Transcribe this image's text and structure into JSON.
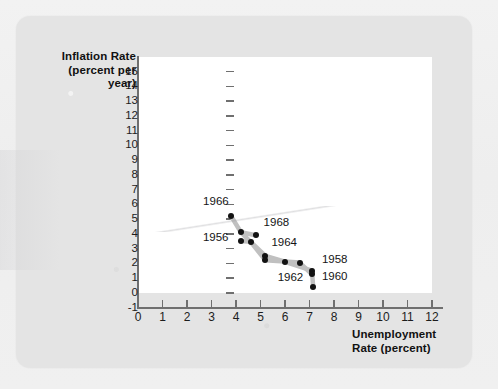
{
  "figure": {
    "y_axis_title_line1": "Inflation Rate",
    "y_axis_title_line2": "(percent per year)",
    "x_axis_title_line1": "Unemployment",
    "x_axis_title_line2": "Rate (percent)",
    "point_color": "#121212",
    "line_color": "#c0c0c0",
    "canvas_color": "#ffffff",
    "card_color": "#e4e4e4"
  },
  "chart_data": {
    "type": "scatter",
    "title": "",
    "xlabel": "Unemployment Rate (percent)",
    "ylabel": "Inflation Rate (percent per year)",
    "xlim": [
      0,
      12
    ],
    "ylim": [
      -1,
      15
    ],
    "xticks": [
      0,
      1,
      2,
      3,
      4,
      5,
      6,
      7,
      8,
      9,
      10,
      11,
      12
    ],
    "yticks": [
      -1,
      0,
      1,
      2,
      3,
      4,
      5,
      6,
      7,
      8,
      9,
      10,
      11,
      12,
      13,
      14,
      15
    ],
    "grid": false,
    "legend": "none",
    "connected": true,
    "annotations": [
      "1956",
      "1958",
      "1960",
      "1962",
      "1964",
      "1966",
      "1968"
    ],
    "points": [
      {
        "label": "1966",
        "x": 3.8,
        "y": 5.2,
        "label_dx": -28,
        "label_dy": -15
      },
      {
        "label": "",
        "x": 4.2,
        "y": 4.1,
        "label_dx": 0,
        "label_dy": 0
      },
      {
        "label": "1968",
        "x": 4.8,
        "y": 3.9,
        "label_dx": 8,
        "label_dy": -13
      },
      {
        "label": "1956",
        "x": 4.2,
        "y": 3.5,
        "label_dx": -38,
        "label_dy": -4
      },
      {
        "label": "",
        "x": 4.6,
        "y": 3.45,
        "label_dx": 0,
        "label_dy": 0
      },
      {
        "label": "1964",
        "x": 5.2,
        "y": 2.5,
        "label_dx": 6,
        "label_dy": -14
      },
      {
        "label": "",
        "x": 5.2,
        "y": 2.2,
        "label_dx": 0,
        "label_dy": 0
      },
      {
        "label": "",
        "x": 6.0,
        "y": 2.1,
        "label_dx": 0,
        "label_dy": 0
      },
      {
        "label": "1962",
        "x": 6.6,
        "y": 2.05,
        "label_dx": -22,
        "label_dy": 14
      },
      {
        "label": "1958",
        "x": 7.1,
        "y": 1.5,
        "label_dx": 10,
        "label_dy": -12
      },
      {
        "label": "1960",
        "x": 7.1,
        "y": 1.25,
        "label_dx": 10,
        "label_dy": 2
      },
      {
        "label": "",
        "x": 7.15,
        "y": 0.4,
        "label_dx": 0,
        "label_dy": 0
      }
    ],
    "paths": [
      [
        [
          3.8,
          5.2
        ],
        [
          4.2,
          4.1
        ],
        [
          4.8,
          3.9
        ]
      ],
      [
        [
          4.2,
          3.5
        ],
        [
          4.6,
          3.45
        ],
        [
          5.2,
          2.5
        ],
        [
          6.0,
          2.1
        ],
        [
          7.1,
          1.5
        ],
        [
          7.15,
          0.4
        ]
      ],
      [
        [
          4.2,
          4.1
        ],
        [
          4.6,
          3.45
        ],
        [
          5.2,
          2.2
        ],
        [
          6.6,
          2.05
        ],
        [
          7.1,
          1.25
        ]
      ]
    ]
  }
}
